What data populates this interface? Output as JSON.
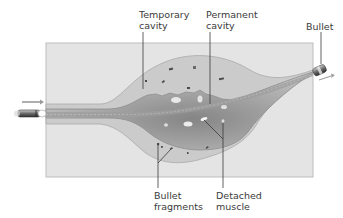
{
  "diagram": {
    "labels": {
      "temporary_cavity": {
        "line1": "Temporary",
        "line2": "cavity"
      },
      "permanent_cavity": {
        "line1": "Permanent",
        "line2": "cavity"
      },
      "bullet": {
        "line1": "Bullet"
      },
      "bullet_fragments": {
        "line1": "Bullet",
        "line2": "fragments"
      },
      "detached_muscle": {
        "line1": "Detached",
        "line2": "muscle"
      }
    },
    "colors": {
      "tissue_block": "#e4e4e4",
      "tissue_border": "#bdbdbd",
      "temporary_cavity": "#c9c9c9",
      "permanent_cavity": "#b0b0b0",
      "permanent_cavity_core": "#8f8f8f",
      "wound_track": "#a8a8a8",
      "leader_line": "#3a3a3a",
      "arrow": "#9a9a9a",
      "text": "#3a3a3a"
    }
  }
}
